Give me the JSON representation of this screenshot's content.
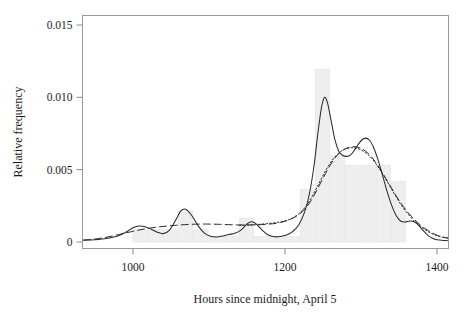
{
  "chart_data": {
    "type": "bar",
    "title": "",
    "subtitle": "",
    "xlabel": "Hours since midnight, April 5",
    "ylabel": "Relative frequency",
    "xlim": [
      935,
      1420
    ],
    "ylim": [
      0,
      0.0157
    ],
    "xticks": [
      1000,
      1200,
      1400
    ],
    "xtick_labels": [
      "1000",
      "1200",
      "1400"
    ],
    "yticks": [
      0,
      0.005,
      0.01,
      0.015
    ],
    "ytick_labels": [
      "0",
      "0.005",
      "0.010",
      "0.015"
    ],
    "grid": false,
    "legend": "none",
    "bar_color": "#eeeeee",
    "bar_edge_color": "#e4e4e4",
    "axis_color": "#8a8a8a",
    "curve_color": "#2b2b2b",
    "bin_width": 20,
    "bins": [
      {
        "x0": 1000,
        "x1": 1020,
        "value": 0.00085
      },
      {
        "x0": 1020,
        "x1": 1040,
        "value": 0.00085
      },
      {
        "x0": 1040,
        "x1": 1060,
        "value": 0.00085
      },
      {
        "x0": 1060,
        "x1": 1080,
        "value": 0.00215
      },
      {
        "x0": 1080,
        "x1": 1100,
        "value": 0.00085
      },
      {
        "x0": 1100,
        "x1": 1120,
        "value": 0.00038
      },
      {
        "x0": 1120,
        "x1": 1140,
        "value": 0.00038
      },
      {
        "x0": 1140,
        "x1": 1160,
        "value": 0.00165
      },
      {
        "x0": 1160,
        "x1": 1180,
        "value": 0.00038
      },
      {
        "x0": 1180,
        "x1": 1200,
        "value": 0.00038
      },
      {
        "x0": 1200,
        "x1": 1220,
        "value": 0.00038
      },
      {
        "x0": 1220,
        "x1": 1240,
        "value": 0.00365
      },
      {
        "x0": 1240,
        "x1": 1260,
        "value": 0.01195
      },
      {
        "x0": 1260,
        "x1": 1280,
        "value": 0.00595
      },
      {
        "x0": 1280,
        "x1": 1300,
        "value": 0.0053
      },
      {
        "x0": 1300,
        "x1": 1320,
        "value": 0.0053
      },
      {
        "x0": 1320,
        "x1": 1340,
        "value": 0.0053
      },
      {
        "x0": 1340,
        "x1": 1360,
        "value": 0.0042
      },
      {
        "x0": 1360,
        "x1": 1380,
        "value": 0.0
      }
    ],
    "series": [
      {
        "name": "kernel density (narrow bandwidth)",
        "style": "solid",
        "points": [
          [
            935,
            0.00012
          ],
          [
            950,
            0.00016
          ],
          [
            965,
            0.00024
          ],
          [
            980,
            0.00042
          ],
          [
            992,
            0.00072
          ],
          [
            1000,
            0.00098
          ],
          [
            1008,
            0.0011
          ],
          [
            1016,
            0.00105
          ],
          [
            1024,
            0.00088
          ],
          [
            1032,
            0.00068
          ],
          [
            1040,
            0.00058
          ],
          [
            1048,
            0.00082
          ],
          [
            1056,
            0.0015
          ],
          [
            1063,
            0.00215
          ],
          [
            1070,
            0.00225
          ],
          [
            1078,
            0.00178
          ],
          [
            1086,
            0.0011
          ],
          [
            1094,
            0.00062
          ],
          [
            1102,
            0.0004
          ],
          [
            1110,
            0.00035
          ],
          [
            1118,
            0.00042
          ],
          [
            1126,
            0.00052
          ],
          [
            1134,
            0.0006
          ],
          [
            1142,
            0.00082
          ],
          [
            1150,
            0.00125
          ],
          [
            1156,
            0.0014
          ],
          [
            1162,
            0.00125
          ],
          [
            1170,
            0.00082
          ],
          [
            1178,
            0.00048
          ],
          [
            1186,
            0.00036
          ],
          [
            1194,
            0.00038
          ],
          [
            1202,
            0.00048
          ],
          [
            1210,
            0.00072
          ],
          [
            1218,
            0.00118
          ],
          [
            1226,
            0.0021
          ],
          [
            1232,
            0.0033
          ],
          [
            1238,
            0.0052
          ],
          [
            1243,
            0.0074
          ],
          [
            1248,
            0.0093
          ],
          [
            1252,
            0.01
          ],
          [
            1256,
            0.0096
          ],
          [
            1261,
            0.0083
          ],
          [
            1266,
            0.007
          ],
          [
            1271,
            0.00625
          ],
          [
            1276,
            0.00598
          ],
          [
            1281,
            0.00592
          ],
          [
            1286,
            0.006
          ],
          [
            1291,
            0.00632
          ],
          [
            1296,
            0.00672
          ],
          [
            1301,
            0.00705
          ],
          [
            1306,
            0.00718
          ],
          [
            1311,
            0.00705
          ],
          [
            1316,
            0.0066
          ],
          [
            1322,
            0.00575
          ],
          [
            1328,
            0.00468
          ],
          [
            1334,
            0.00355
          ],
          [
            1340,
            0.00258
          ],
          [
            1346,
            0.00185
          ],
          [
            1352,
            0.00145
          ],
          [
            1358,
            0.00138
          ],
          [
            1364,
            0.00145
          ],
          [
            1370,
            0.0014
          ],
          [
            1376,
            0.00115
          ],
          [
            1382,
            0.00078
          ],
          [
            1388,
            0.00046
          ],
          [
            1394,
            0.00026
          ],
          [
            1400,
            0.00015
          ],
          [
            1410,
            0.0001
          ],
          [
            1420,
            8e-05
          ]
        ]
      },
      {
        "name": "kernel density (wide bandwidth)",
        "style": "dashed",
        "points": [
          [
            935,
            0.00014
          ],
          [
            955,
            0.00024
          ],
          [
            975,
            0.00044
          ],
          [
            995,
            0.00068
          ],
          [
            1015,
            0.0009
          ],
          [
            1035,
            0.00105
          ],
          [
            1055,
            0.00115
          ],
          [
            1075,
            0.00122
          ],
          [
            1095,
            0.00124
          ],
          [
            1115,
            0.00122
          ],
          [
            1135,
            0.00118
          ],
          [
            1155,
            0.00118
          ],
          [
            1175,
            0.00122
          ],
          [
            1195,
            0.00136
          ],
          [
            1215,
            0.00178
          ],
          [
            1228,
            0.0024
          ],
          [
            1238,
            0.0032
          ],
          [
            1248,
            0.0042
          ],
          [
            1258,
            0.00518
          ],
          [
            1268,
            0.00595
          ],
          [
            1278,
            0.0064
          ],
          [
            1288,
            0.00658
          ],
          [
            1298,
            0.00652
          ],
          [
            1308,
            0.0062
          ],
          [
            1318,
            0.0056
          ],
          [
            1328,
            0.0048
          ],
          [
            1338,
            0.00392
          ],
          [
            1348,
            0.00305
          ],
          [
            1358,
            0.00228
          ],
          [
            1368,
            0.00168
          ],
          [
            1378,
            0.00118
          ],
          [
            1388,
            0.0008
          ],
          [
            1398,
            0.00052
          ],
          [
            1408,
            0.00034
          ],
          [
            1420,
            0.00022
          ]
        ]
      },
      {
        "name": "kernel density (alternate estimator)",
        "style": "dotted",
        "points": [
          [
            1140,
            0.00116
          ],
          [
            1155,
            0.00118
          ],
          [
            1170,
            0.00124
          ],
          [
            1185,
            0.00132
          ],
          [
            1200,
            0.00146
          ],
          [
            1212,
            0.00172
          ],
          [
            1224,
            0.00225
          ],
          [
            1234,
            0.003
          ],
          [
            1244,
            0.00398
          ],
          [
            1254,
            0.00498
          ],
          [
            1264,
            0.00578
          ],
          [
            1274,
            0.00628
          ],
          [
            1284,
            0.0065
          ],
          [
            1294,
            0.00648
          ],
          [
            1304,
            0.00625
          ],
          [
            1314,
            0.00578
          ],
          [
            1324,
            0.00508
          ],
          [
            1334,
            0.00422
          ],
          [
            1344,
            0.00332
          ],
          [
            1354,
            0.00248
          ],
          [
            1364,
            0.0018
          ],
          [
            1374,
            0.00126
          ],
          [
            1384,
            0.00086
          ],
          [
            1394,
            0.00056
          ],
          [
            1404,
            0.00036
          ],
          [
            1420,
            0.00022
          ]
        ]
      }
    ]
  }
}
